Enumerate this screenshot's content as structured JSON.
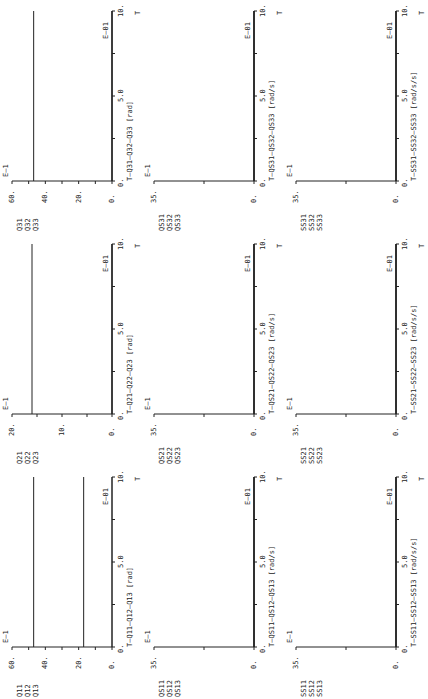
{
  "page": {
    "orientation": "rotated-90"
  },
  "chart_data": [
    {
      "id": "q1",
      "type": "line",
      "legend": [
        "Q11",
        "Q12",
        "Q13"
      ],
      "xlabel": "T—Q11—Q12—Q13 [rad]",
      "x_title": "T",
      "x_scale": "E—01",
      "y_scale": "E—1",
      "xlim": [
        0,
        10
      ],
      "ylim": [
        0,
        60
      ],
      "yticks": [
        "0.",
        "20.",
        "40.",
        "60."
      ],
      "xticks": [
        "0.",
        "5.0",
        "10."
      ],
      "series": [
        {
          "name": "Q11",
          "x": [
            0,
            10
          ],
          "values": [
            47,
            47
          ]
        },
        {
          "name": "Q12",
          "x": [
            0,
            10
          ],
          "values": [
            17,
            17
          ]
        },
        {
          "name": "Q13",
          "x": [
            0,
            10
          ],
          "values": [
            0,
            0
          ]
        }
      ]
    },
    {
      "id": "q2",
      "type": "line",
      "legend": [
        "Q21",
        "Q22",
        "Q23"
      ],
      "xlabel": "T—Q21—Q22—Q23 [rad]",
      "x_title": "T",
      "x_scale": "E—01",
      "y_scale": "E—1",
      "xlim": [
        0,
        10
      ],
      "ylim": [
        0,
        20
      ],
      "yticks": [
        "0.",
        "10.",
        "20."
      ],
      "xticks": [
        "0.",
        "5.0",
        "10."
      ],
      "series": [
        {
          "name": "Q21",
          "x": [
            0,
            10
          ],
          "values": [
            16,
            16
          ]
        },
        {
          "name": "Q22",
          "x": [
            0,
            10
          ],
          "values": [
            0,
            0
          ]
        },
        {
          "name": "Q23",
          "x": [
            0,
            10
          ],
          "values": [
            0,
            0
          ]
        }
      ]
    },
    {
      "id": "q3",
      "type": "line",
      "legend": [
        "Q31",
        "Q32",
        "Q33"
      ],
      "xlabel": "T—Q31—Q32—Q33 [rad]",
      "x_title": "T",
      "x_scale": "E—01",
      "y_scale": "E—1",
      "xlim": [
        0,
        10
      ],
      "ylim": [
        0,
        60
      ],
      "yticks": [
        "0.",
        "20.",
        "40.",
        "60."
      ],
      "xticks": [
        "0.",
        "5.0",
        "10."
      ],
      "series": [
        {
          "name": "Q31",
          "x": [
            0,
            10
          ],
          "values": [
            47,
            47
          ]
        },
        {
          "name": "Q32",
          "x": [
            0,
            10
          ],
          "values": [
            0,
            0
          ]
        },
        {
          "name": "Q33",
          "x": [
            0,
            10
          ],
          "values": [
            0,
            0
          ]
        }
      ]
    },
    {
      "id": "qs1",
      "type": "line",
      "legend": [
        "QS11",
        "QS12",
        "QS13"
      ],
      "xlabel": "T—QS11—QS12—QS13 [rad/s]",
      "x_title": "T",
      "x_scale": "E—01",
      "y_scale": "E—1",
      "xlim": [
        0,
        10
      ],
      "ylim": [
        0,
        35
      ],
      "yticks": [
        "0.",
        "35."
      ],
      "xticks": [
        "0.",
        "5.0",
        "10."
      ],
      "series": [
        {
          "name": "QS11",
          "x": [
            0,
            10
          ],
          "values": [
            0,
            0
          ]
        },
        {
          "name": "QS12",
          "x": [
            0,
            10
          ],
          "values": [
            0,
            0
          ]
        },
        {
          "name": "QS13",
          "x": [
            0,
            10
          ],
          "values": [
            0,
            0
          ]
        }
      ]
    },
    {
      "id": "qs2",
      "type": "line",
      "legend": [
        "QS21",
        "QS22",
        "QS23"
      ],
      "xlabel": "T—QS21—QS22—QS23 [rad/s]",
      "x_title": "T",
      "x_scale": "E—01",
      "y_scale": "E—1",
      "xlim": [
        0,
        10
      ],
      "ylim": [
        0,
        35
      ],
      "yticks": [
        "0.",
        "35."
      ],
      "xticks": [
        "0.",
        "5.0",
        "10."
      ],
      "series": [
        {
          "name": "QS21",
          "x": [
            0,
            10
          ],
          "values": [
            0,
            0
          ]
        },
        {
          "name": "QS22",
          "x": [
            0,
            10
          ],
          "values": [
            0,
            0
          ]
        },
        {
          "name": "QS23",
          "x": [
            0,
            10
          ],
          "values": [
            0,
            0
          ]
        }
      ]
    },
    {
      "id": "qs3",
      "type": "line",
      "legend": [
        "QS31",
        "QS32",
        "QS33"
      ],
      "xlabel": "T—QS31—QS32—QS33 [rad/s]",
      "x_title": "T",
      "x_scale": "E—01",
      "y_scale": "E—1",
      "xlim": [
        0,
        10
      ],
      "ylim": [
        0,
        35
      ],
      "yticks": [
        "0.",
        "35."
      ],
      "xticks": [
        "0.",
        "5.0",
        "10."
      ],
      "series": [
        {
          "name": "QS31",
          "x": [
            0,
            10
          ],
          "values": [
            0,
            0
          ]
        },
        {
          "name": "QS32",
          "x": [
            0,
            10
          ],
          "values": [
            0,
            0
          ]
        },
        {
          "name": "QS33",
          "x": [
            0,
            10
          ],
          "values": [
            0,
            0
          ]
        }
      ]
    },
    {
      "id": "ss1",
      "type": "line",
      "legend": [
        "SS11",
        "SS12",
        "SS13"
      ],
      "xlabel": "T—SS11—SS12—SS13 [rad/s/s]",
      "x_title": "T",
      "x_scale": "E—01",
      "y_scale": "E—1",
      "xlim": [
        0,
        10
      ],
      "ylim": [
        0,
        35
      ],
      "yticks": [
        "0.",
        "35."
      ],
      "xticks": [
        "0.",
        "5.0",
        "10."
      ],
      "series": [
        {
          "name": "SS11",
          "x": [
            0,
            10
          ],
          "values": [
            0,
            0
          ]
        },
        {
          "name": "SS12",
          "x": [
            0,
            10
          ],
          "values": [
            0,
            0
          ]
        },
        {
          "name": "SS13",
          "x": [
            0,
            10
          ],
          "values": [
            0,
            0
          ]
        }
      ]
    },
    {
      "id": "ss2",
      "type": "line",
      "legend": [
        "SS21",
        "SS22",
        "SS23"
      ],
      "xlabel": "T—SS21—SS22—SS23 [rad/s/s]",
      "x_title": "T",
      "x_scale": "E—01",
      "y_scale": "E—1",
      "xlim": [
        0,
        10
      ],
      "ylim": [
        0,
        35
      ],
      "yticks": [
        "0.",
        "35."
      ],
      "xticks": [
        "0.",
        "5.0",
        "10."
      ],
      "series": [
        {
          "name": "SS21",
          "x": [
            0,
            10
          ],
          "values": [
            0,
            0
          ]
        },
        {
          "name": "SS22",
          "x": [
            0,
            10
          ],
          "values": [
            0,
            0
          ]
        },
        {
          "name": "SS23",
          "x": [
            0,
            10
          ],
          "values": [
            0,
            0
          ]
        }
      ]
    },
    {
      "id": "ss3",
      "type": "line",
      "legend": [
        "SS31",
        "SS32",
        "SS33"
      ],
      "xlabel": "T—SS31—SS32—SS33 [rad/s/s]",
      "x_title": "T",
      "x_scale": "E—01",
      "y_scale": "E—1",
      "xlim": [
        0,
        10
      ],
      "ylim": [
        0,
        35
      ],
      "yticks": [
        "0.",
        "35."
      ],
      "xticks": [
        "0.",
        "5.0",
        "10."
      ],
      "series": [
        {
          "name": "SS31",
          "x": [
            0,
            10
          ],
          "values": [
            0,
            0
          ]
        },
        {
          "name": "SS32",
          "x": [
            0,
            10
          ],
          "values": [
            0,
            0
          ]
        },
        {
          "name": "SS33",
          "x": [
            0,
            10
          ],
          "values": [
            0,
            0
          ]
        }
      ]
    }
  ]
}
